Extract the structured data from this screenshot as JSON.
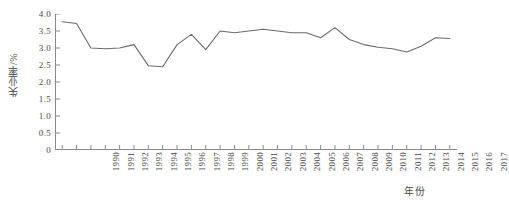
{
  "chart_data": {
    "type": "line",
    "title": "",
    "xlabel": "年份",
    "ylabel": "失业率/%",
    "grid": false,
    "legend": "none",
    "line_color": "#6b6b6b",
    "axis_color": "#8a8a8a",
    "xlim": [
      1990,
      2017
    ],
    "ylim": [
      0,
      4.0
    ],
    "ytick_labels": [
      "4.0",
      "3.5",
      "3.0",
      "2.5",
      "2.0",
      "1.5",
      "1.0",
      "0.5",
      "0"
    ],
    "ytick_values": [
      4.0,
      3.5,
      3.0,
      2.5,
      2.0,
      1.5,
      1.0,
      0.5,
      0
    ],
    "categories": [
      "1990",
      "1991",
      "1992",
      "1993",
      "1994",
      "1995",
      "1996",
      "1997",
      "1998",
      "1999",
      "2000",
      "2001",
      "2002",
      "2003",
      "2004",
      "2005",
      "2006",
      "2007",
      "2008",
      "2009",
      "2010",
      "2011",
      "2012",
      "2013",
      "2014",
      "2015",
      "2016",
      "2017"
    ],
    "x": [
      1990,
      1991,
      1992,
      1993,
      1994,
      1995,
      1996,
      1997,
      1998,
      1999,
      2000,
      2001,
      2002,
      2003,
      2004,
      2005,
      2006,
      2007,
      2008,
      2009,
      2010,
      2011,
      2012,
      2013,
      2014,
      2015,
      2016,
      2017
    ],
    "values": [
      3.77,
      3.72,
      3.0,
      2.98,
      3.0,
      3.1,
      2.48,
      2.45,
      3.1,
      3.4,
      2.95,
      3.5,
      3.45,
      3.5,
      3.55,
      3.5,
      3.45,
      3.45,
      3.3,
      3.6,
      3.25,
      3.1,
      3.02,
      2.98,
      2.88,
      3.05,
      3.3,
      3.28
    ],
    "series": [
      {
        "name": "失业率",
        "values": [
          3.77,
          3.72,
          3.0,
          2.98,
          3.0,
          3.1,
          2.48,
          2.45,
          3.1,
          3.4,
          2.95,
          3.5,
          3.45,
          3.5,
          3.55,
          3.5,
          3.45,
          3.45,
          3.3,
          3.6,
          3.25,
          3.1,
          3.02,
          2.98,
          2.88,
          3.05,
          3.3,
          3.28
        ]
      }
    ]
  }
}
